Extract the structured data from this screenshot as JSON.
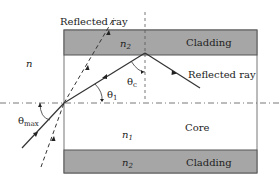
{
  "diagram": {
    "labels": {
      "outer_medium": "n",
      "top_reflected_ray": "Reflected ray",
      "right_reflected_ray": "Reflected ray",
      "top_cladding_index_n": "n",
      "top_cladding_index_sub": "2",
      "top_cladding": "Cladding",
      "core_index_n": "n",
      "core_index_sub": "1",
      "core": "Core",
      "bottom_cladding_index_n": "n",
      "bottom_cladding_index_sub": "2",
      "bottom_cladding": "Cladding",
      "theta_c": "θ",
      "theta_c_sub": "c",
      "theta_1": "θ",
      "theta_1_sub": "1",
      "theta_max": "θ",
      "theta_max_sub": "max"
    },
    "colors": {
      "cladding_fill": "#a6a6a6",
      "line": "#333333",
      "border": "#555555",
      "background": "#ffffff"
    }
  }
}
